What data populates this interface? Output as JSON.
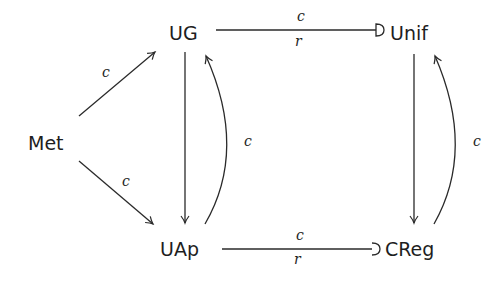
{
  "diagram": {
    "type": "commutative-diagram",
    "nodes": {
      "met": {
        "label": "Met"
      },
      "ug": {
        "label": "UG"
      },
      "uap": {
        "label": "UAp"
      },
      "unif": {
        "label": "Unif"
      },
      "creg": {
        "label": "CReg"
      }
    },
    "edges": {
      "met_ug": {
        "from": "Met",
        "to": "UG",
        "label": "c",
        "style": "arrow"
      },
      "met_uap": {
        "from": "Met",
        "to": "UAp",
        "label": "c",
        "style": "arrow"
      },
      "ug_uap": {
        "from": "UG",
        "to": "UAp",
        "label": "",
        "style": "arrow"
      },
      "uap_ug": {
        "from": "UAp",
        "to": "UG",
        "label": "c",
        "style": "curved-arrow"
      },
      "ug_unif": {
        "from": "UG",
        "to": "Unif",
        "label_top": "c",
        "label_bottom": "r",
        "style": "hook-arrow"
      },
      "uap_creg": {
        "from": "UAp",
        "to": "CReg",
        "label_top": "c",
        "label_bottom": "r",
        "style": "hook-arrow"
      },
      "unif_creg": {
        "from": "Unif",
        "to": "CReg",
        "label": "",
        "style": "arrow"
      },
      "creg_unif": {
        "from": "CReg",
        "to": "Unif",
        "label": "c",
        "style": "curved-arrow"
      }
    }
  },
  "colors": {
    "stroke": "#2a2a2a",
    "text": "#1e1e1e",
    "background": "#ffffff"
  }
}
